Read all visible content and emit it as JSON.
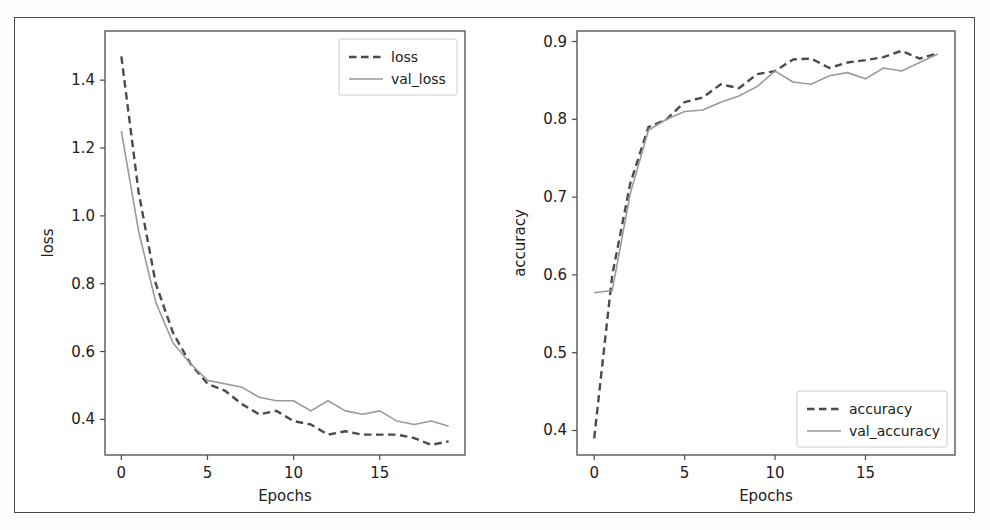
{
  "figure": {
    "background_color": "#ffffff",
    "frame_color": "#4a4a4a",
    "dashed_color": "#4a4a52",
    "solid_color": "#9a9a9a"
  },
  "chart_data": [
    {
      "type": "line",
      "title": "",
      "xlabel": "Epochs",
      "ylabel": "loss",
      "xlim": [
        -0.95,
        19.95
      ],
      "ylim": [
        0.295,
        1.545
      ],
      "xticks": [
        0,
        5,
        10,
        15
      ],
      "xticklabels": [
        "0",
        "5",
        "10",
        "15"
      ],
      "yticks": [
        0.4,
        0.6,
        0.8,
        1.0,
        1.2,
        1.4
      ],
      "yticklabels": [
        "0.4",
        "0.6",
        "0.8",
        "1.0",
        "1.2",
        "1.4"
      ],
      "grid": false,
      "legend_position": "upper right",
      "x": [
        0,
        1,
        2,
        3,
        4,
        5,
        6,
        7,
        8,
        9,
        10,
        11,
        12,
        13,
        14,
        15,
        16,
        17,
        18,
        19
      ],
      "series": [
        {
          "name": "loss",
          "style": "dashed",
          "color": "#4a4a52",
          "values": [
            1.47,
            1.07,
            0.8,
            0.655,
            0.565,
            0.505,
            0.485,
            0.445,
            0.415,
            0.425,
            0.395,
            0.385,
            0.355,
            0.365,
            0.355,
            0.355,
            0.355,
            0.345,
            0.325,
            0.335
          ]
        },
        {
          "name": "val_loss",
          "style": "solid",
          "color": "#9a9a9a",
          "values": [
            1.25,
            0.955,
            0.745,
            0.625,
            0.565,
            0.515,
            0.505,
            0.495,
            0.465,
            0.455,
            0.455,
            0.425,
            0.455,
            0.425,
            0.415,
            0.425,
            0.395,
            0.385,
            0.395,
            0.38
          ]
        }
      ]
    },
    {
      "type": "line",
      "title": "",
      "xlabel": "Epochs",
      "ylabel": "accuracy",
      "xlim": [
        -0.95,
        19.95
      ],
      "ylim": [
        0.3685,
        0.9135
      ],
      "xticks": [
        0,
        5,
        10,
        15
      ],
      "xticklabels": [
        "0",
        "5",
        "10",
        "15"
      ],
      "yticks": [
        0.4,
        0.5,
        0.6,
        0.7,
        0.8,
        0.9
      ],
      "yticklabels": [
        "0.4",
        "0.5",
        "0.6",
        "0.7",
        "0.8",
        "0.9"
      ],
      "grid": false,
      "legend_position": "lower right",
      "x": [
        0,
        1,
        2,
        3,
        4,
        5,
        6,
        7,
        8,
        9,
        10,
        11,
        12,
        13,
        14,
        15,
        16,
        17,
        18,
        19
      ],
      "series": [
        {
          "name": "accuracy",
          "style": "dashed",
          "color": "#4a4a52",
          "values": [
            0.39,
            0.6,
            0.718,
            0.79,
            0.8,
            0.822,
            0.828,
            0.845,
            0.84,
            0.858,
            0.862,
            0.877,
            0.878,
            0.866,
            0.873,
            0.876,
            0.88,
            0.888,
            0.878,
            0.885
          ]
        },
        {
          "name": "val_accuracy",
          "style": "solid",
          "color": "#9a9a9a",
          "values": [
            0.577,
            0.58,
            0.705,
            0.786,
            0.8,
            0.81,
            0.812,
            0.822,
            0.83,
            0.842,
            0.862,
            0.848,
            0.845,
            0.856,
            0.86,
            0.852,
            0.866,
            0.862,
            0.873,
            0.884
          ]
        }
      ]
    }
  ],
  "axes": [
    {
      "id": "loss-axes",
      "legend": {
        "entries": [
          "loss",
          "val_loss"
        ]
      }
    },
    {
      "id": "accuracy-axes",
      "legend": {
        "entries": [
          "accuracy",
          "val_accuracy"
        ]
      }
    }
  ]
}
